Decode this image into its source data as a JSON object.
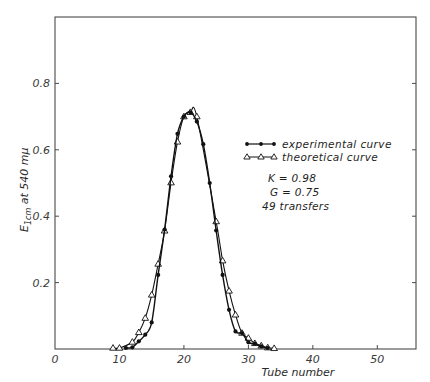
{
  "chart_data": {
    "type": "line",
    "title": "",
    "xlabel": "Tube number",
    "ylabel": "E1cm at 540 mμ",
    "ylabel_main": "E",
    "ylabel_sub": "1cm",
    "ylabel_rest": " at 540 mμ",
    "xlim": [
      0,
      56
    ],
    "ylim": [
      0,
      1.0
    ],
    "xticks": [
      0,
      10,
      20,
      30,
      40,
      50
    ],
    "xtick_labels": [
      "0",
      "10",
      "20",
      "30",
      "40",
      "50"
    ],
    "yticks": [
      0.2,
      0.4,
      0.6,
      0.8
    ],
    "ytick_labels": [
      "0.2",
      "0.4",
      "0.6",
      "0.8"
    ],
    "grid": false,
    "legend_position": "upper right (inside)",
    "series": [
      {
        "name": "experimental curve",
        "marker": "filled-circle",
        "x": [
          11,
          12,
          13,
          14,
          15,
          16,
          17,
          18,
          19,
          20,
          21,
          22,
          23,
          24,
          25,
          26,
          27,
          28,
          29,
          30,
          31,
          32,
          33
        ],
        "values": [
          0.003,
          0.005,
          0.023,
          0.043,
          0.08,
          0.223,
          0.36,
          0.52,
          0.648,
          0.7,
          0.713,
          0.685,
          0.617,
          0.5,
          0.357,
          0.223,
          0.118,
          0.053,
          0.048,
          0.02,
          0.016,
          0.008,
          0.003
        ]
      },
      {
        "name": "theoretical curve",
        "marker": "open-triangle",
        "x": [
          9,
          10,
          12,
          13,
          14,
          15,
          16,
          17,
          18,
          19,
          20,
          21,
          22,
          25,
          26,
          27,
          28,
          29,
          30,
          31,
          32,
          33,
          34
        ],
        "values": [
          0.003,
          0.003,
          0.021,
          0.05,
          0.093,
          0.163,
          0.256,
          0.356,
          0.501,
          0.624,
          0.7,
          0.713,
          0.7,
          0.384,
          0.266,
          0.175,
          0.103,
          0.048,
          0.033,
          0.017,
          0.01,
          0.004,
          0.002
        ]
      }
    ],
    "annotations": [
      "K = 0.98",
      "G = 0.75",
      "49 transfers"
    ]
  },
  "legend": {
    "experimental": "experimental curve",
    "theoretical": "theoretical curve"
  },
  "annotations": {
    "k": "K = 0.98",
    "g": "G = 0.75",
    "transfers": "49 transfers"
  },
  "axes": {
    "xlabel": "Tube number"
  }
}
